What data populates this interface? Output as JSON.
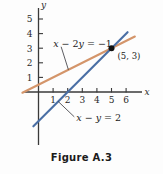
{
  "figure": {
    "caption": "Figure A.3"
  },
  "chart_data": {
    "type": "line",
    "title": "Figure A.3",
    "xlabel": "x",
    "ylabel": "y",
    "xlim": [
      -1,
      7
    ],
    "ylim": [
      -2.5,
      6
    ],
    "xticks": [
      1,
      2,
      3,
      4,
      5,
      6
    ],
    "yticks": [
      1,
      2,
      3,
      4,
      5
    ],
    "xtick_labels": [
      "1",
      "2",
      "3",
      "4",
      "5",
      "6"
    ],
    "ytick_labels": [
      "1",
      "2",
      "3",
      "4",
      "5"
    ],
    "grid": false,
    "legend": "none",
    "series": [
      {
        "name": "x - 2y = -1",
        "label": "x − 2y = −1",
        "label_parts": {
          "v1": "x",
          "op": " − 2",
          "v2": "y",
          "eq": " = −1"
        },
        "color": "#D4956A",
        "slope": 0.5,
        "intercept": 0.5,
        "x_from": -1.1,
        "x_to": 6.6,
        "leader_from": [
          2.05,
          1.52
        ],
        "leader_to": [
          1.55,
          3.1
        ]
      },
      {
        "name": "x - y = 2",
        "label": "x − y = 2",
        "label_parts": {
          "v1": "x",
          "op": " − ",
          "v2": "y",
          "eq": " = 2"
        },
        "color": "#4A6FA5",
        "slope": 1,
        "intercept": -2,
        "x_from": -0.35,
        "x_to": 6.1,
        "leader_from": [
          1.35,
          -0.65
        ],
        "leader_to": [
          2.45,
          -1.7
        ]
      }
    ],
    "points": [
      {
        "label": "(5, 3)",
        "x": 5,
        "y": 3,
        "color": "#111111",
        "label_dx": 6,
        "label_dy": 11
      }
    ],
    "annotations": [
      {
        "text": "x − 2y = −1",
        "x": 1.55,
        "y": 3.1
      },
      {
        "text": "x − y = 2",
        "x": 2.45,
        "y": -1.7
      },
      {
        "text": "(5, 3)",
        "x": 5.4,
        "y": 2.25
      }
    ]
  },
  "colors": {
    "line_orange": "#D4956A",
    "line_blue": "#4A6FA5",
    "axis": "#3a3a3a",
    "point": "#111111",
    "background": "#fdfdfd",
    "text": "#1b1b1b"
  }
}
